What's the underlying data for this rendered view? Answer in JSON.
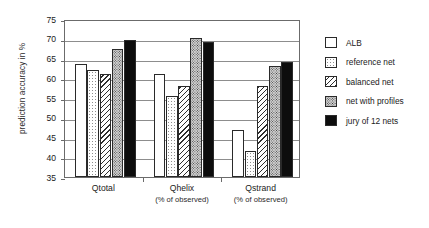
{
  "chart_data": {
    "type": "bar",
    "title": "",
    "xlabel": "",
    "ylabel": "prediction accuracy in %",
    "ylim": [
      35,
      75
    ],
    "yticks": [
      35,
      40,
      45,
      50,
      55,
      60,
      65,
      70,
      75
    ],
    "grid": true,
    "legend_position": "right",
    "categories": [
      "Qtotal",
      "Qhelix",
      "Qstrand"
    ],
    "category_sublabels": [
      "",
      "(% of observed)",
      "(% of observed)"
    ],
    "series": [
      {
        "name": "ALB",
        "pattern": "plain",
        "values": [
          63.5,
          61.0,
          47.0
        ]
      },
      {
        "name": "reference net",
        "pattern": "dots",
        "values": [
          62.0,
          55.5,
          41.5
        ]
      },
      {
        "name": "balanced net",
        "pattern": "hatch",
        "values": [
          61.0,
          58.0,
          58.0
        ]
      },
      {
        "name": "net with profiles",
        "pattern": "stipple",
        "values": [
          67.5,
          70.2,
          63.0
        ]
      },
      {
        "name": "jury of 12 nets",
        "pattern": "solid",
        "values": [
          69.8,
          69.3,
          64.0
        ]
      }
    ]
  },
  "legend": {
    "items": [
      {
        "label": "ALB"
      },
      {
        "label": "reference net"
      },
      {
        "label": "balanced net"
      },
      {
        "label": "net with profiles"
      },
      {
        "label": "jury of 12 nets"
      }
    ]
  },
  "axis": {
    "y_title": "prediction accuracy in %",
    "y_tick_labels": [
      "75",
      "70",
      "65",
      "60",
      "55",
      "50",
      "45",
      "40",
      "35"
    ],
    "x_labels": [
      {
        "name": "Qtotal",
        "sub": ""
      },
      {
        "name": "Qhelix",
        "sub": "(% of observed)"
      },
      {
        "name": "Qstrand",
        "sub": "(% of observed)"
      }
    ]
  }
}
